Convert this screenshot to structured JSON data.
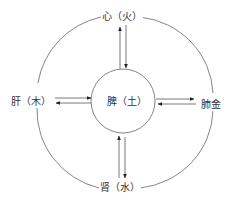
{
  "diagram": {
    "type": "five-elements-organ-relationship",
    "nodes": {
      "top": {
        "label": "心（火）"
      },
      "left": {
        "label": "肝（木）"
      },
      "right": {
        "label": "肺金"
      },
      "bottom": {
        "label": "肾（水）"
      },
      "center": {
        "label": "脾（土）"
      }
    },
    "edges": [
      {
        "from": "center",
        "to": "top",
        "bidirectional": true
      },
      {
        "from": "center",
        "to": "bottom",
        "bidirectional": true
      },
      {
        "from": "center",
        "to": "left",
        "bidirectional": true
      },
      {
        "from": "center",
        "to": "right",
        "bidirectional": true
      }
    ],
    "colors": {
      "line": "#555555",
      "background": "#ffffff",
      "text": "#333333"
    }
  }
}
